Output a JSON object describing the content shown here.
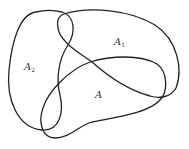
{
  "diagram": {
    "type": "set-overlap-diagram",
    "stroke_color": "#222222",
    "background": "#ffffff",
    "regions": [
      {
        "id": "A2",
        "base": "A",
        "subscript": "2"
      },
      {
        "id": "A1",
        "base": "A",
        "subscript": "1"
      },
      {
        "id": "A",
        "base": "A",
        "subscript": ""
      }
    ]
  }
}
